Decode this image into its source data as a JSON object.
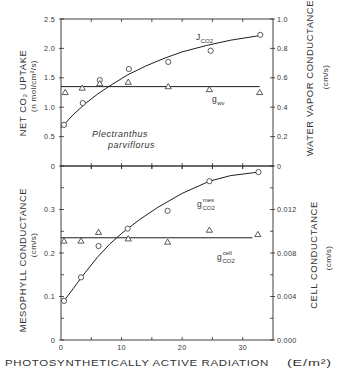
{
  "figure": {
    "xlabel_main": "PHOTOSYNTHETICALLY ACTIVE RADIATION",
    "xlabel_units": "(E/m²)",
    "species_line1": "Plectranthus",
    "species_line2": "parviflorus",
    "top_left_title": "NET CO₂ UPTAKE",
    "top_left_units": "(n mol/cm²/s)",
    "top_right_title": "WATER VAPOR CONDUCTANCE",
    "top_right_units": "(cm/s)",
    "bottom_left_title": "MESOPHYLL  CONDUCTANCE",
    "bottom_left_units": "(cm/s)",
    "bottom_right_title": "CELL CONDUCTANCE",
    "bottom_right_units": "(cm/s)"
  },
  "chart_data": [
    {
      "type": "scatter",
      "panel": "top",
      "title": "",
      "xlabel": "PHOTOSYNTHETICALLY ACTIVE RADIATION (E/m²)",
      "xlim": [
        0,
        35
      ],
      "xticks": [
        0,
        5,
        10,
        15,
        20,
        25,
        30
      ],
      "xtick_labels": [],
      "ylabel": "NET CO₂ UPTAKE (n mol/cm²/s)",
      "ylim": [
        0,
        2.5
      ],
      "yticks": [
        0,
        0.5,
        1.0,
        1.5,
        2.0,
        2.5
      ],
      "ytick_labels": [
        "0",
        "0.5",
        "1.0",
        "1.5",
        "2.0",
        "2.5"
      ],
      "yminor": [],
      "y2label": "WATER VAPOR CONDUCTANCE (cm/s)",
      "y2lim": [
        0,
        1.0
      ],
      "y2ticks": [
        0,
        0.2,
        0.4,
        0.6,
        0.8,
        1.0
      ],
      "y2tick_labels": [
        "0",
        "0.2",
        "0.4",
        "0.6",
        "0.8",
        "1.0"
      ],
      "y2minor": [],
      "grid": false,
      "annotations": [
        "Plectranthus parviflorus"
      ],
      "series": [
        {
          "name": "J_CO2",
          "label": {
            "main": "J",
            "sub": "CO2",
            "sup": ""
          },
          "axis": "left",
          "marker": "circle",
          "x": [
            0.5,
            3.6,
            6.4,
            11.2,
            17.7,
            24.7,
            32.9
          ],
          "y": [
            0.7,
            1.07,
            1.46,
            1.65,
            1.77,
            1.96,
            2.23
          ],
          "fit": {
            "type": "curve",
            "x": [
              0,
              2,
              4,
              6,
              8,
              11,
              14,
              17,
              20,
              24,
              28,
              32.9
            ],
            "y": [
              0.65,
              0.87,
              1.06,
              1.22,
              1.36,
              1.55,
              1.7,
              1.83,
              1.94,
              2.05,
              2.14,
              2.22
            ]
          }
        },
        {
          "name": "g_wv",
          "label": {
            "main": "g",
            "sub": "wv",
            "sup": ""
          },
          "axis": "right",
          "marker": "triangle",
          "x": [
            0.7,
            3.5,
            6.4,
            11.1,
            17.7,
            24.5,
            32.8
          ],
          "y": [
            0.5,
            0.53,
            0.56,
            0.57,
            0.54,
            0.52,
            0.5
          ],
          "fit": {
            "type": "constant",
            "value": 0.54,
            "x": [
              0,
              32.8
            ]
          }
        }
      ]
    },
    {
      "type": "scatter",
      "panel": "bottom",
      "title": "",
      "xlabel": "PHOTOSYNTHETICALLY ACTIVE RADIATION (E/m²)",
      "xlim": [
        0,
        35
      ],
      "xticks": [
        0,
        5,
        10,
        15,
        20,
        25,
        30
      ],
      "xtick_labels": [
        "0",
        "",
        "10",
        "",
        "20",
        "",
        "30"
      ],
      "ylabel": "MESOPHYLL CONDUCTANCE (cm/s)",
      "ylim": [
        0,
        0.4
      ],
      "yticks": [
        0,
        0.1,
        0.2,
        0.3
      ],
      "ytick_labels": [
        "0",
        "0.1",
        "0.2",
        "0.3"
      ],
      "yminor": [
        0.05,
        0.15,
        0.25,
        0.35
      ],
      "y2label": "CELL CONDUCTANCE (cm/s)",
      "y2lim": [
        0,
        0.016
      ],
      "y2ticks": [
        0,
        0.004,
        0.008,
        0.012
      ],
      "y2tick_labels": [
        "0.000",
        "0.004",
        "0.008",
        "0.012"
      ],
      "y2minor": [
        0.002,
        0.006,
        0.01,
        0.014
      ],
      "grid": false,
      "annotations": [],
      "series": [
        {
          "name": "g_CO2^mes",
          "label": {
            "main": "g",
            "sub": "CO2",
            "sup": "mes"
          },
          "axis": "left",
          "marker": "circle",
          "x": [
            0.5,
            3.3,
            6.2,
            11.0,
            17.6,
            24.5,
            32.6
          ],
          "y": [
            0.09,
            0.144,
            0.216,
            0.256,
            0.297,
            0.365,
            0.386
          ],
          "fit": {
            "type": "curve",
            "x": [
              0.5,
              2,
              4,
              6,
              8,
              10,
              13,
              16,
              20,
              24.5,
              28,
              32.6
            ],
            "y": [
              0.09,
              0.118,
              0.155,
              0.19,
              0.22,
              0.245,
              0.277,
              0.305,
              0.337,
              0.365,
              0.378,
              0.386
            ]
          }
        },
        {
          "name": "g_CO2^cell",
          "label": {
            "main": "g",
            "sub": "CO2",
            "sup": "cell"
          },
          "axis": "right",
          "marker": "triangle",
          "x": [
            0.5,
            3.3,
            6.2,
            11.1,
            17.6,
            24.5,
            32.5
          ],
          "y": [
            0.0091,
            0.0091,
            0.0099,
            0.0093,
            0.009,
            0.0101,
            0.0097
          ],
          "fit": {
            "type": "constant",
            "value": 0.0094,
            "x": [
              0,
              31.6
            ]
          }
        }
      ]
    }
  ]
}
